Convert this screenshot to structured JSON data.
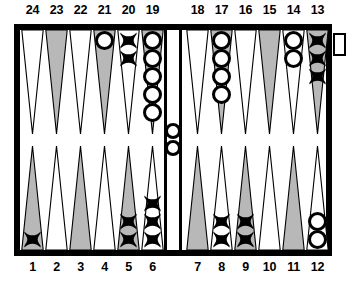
{
  "colors": {
    "board_frame": "#000000",
    "felt": "#ffffff",
    "point_shaded": "#b8b8b8",
    "point_plain": "#ffffff",
    "point_outline": "#000000",
    "checker_o_fill": "#ffffff",
    "checker_o_outline": "#000000",
    "checker_x": "#000000"
  },
  "labels": {
    "top": [
      "24",
      "23",
      "22",
      "21",
      "20",
      "19",
      "18",
      "17",
      "16",
      "15",
      "14",
      "13"
    ],
    "bottom": [
      "1",
      "2",
      "3",
      "4",
      "5",
      "6",
      "7",
      "8",
      "9",
      "10",
      "11",
      "12"
    ]
  },
  "board": {
    "bar": {
      "checkers": "O",
      "count": 2
    },
    "bearoff_tray": {
      "checkers": "",
      "count": 0
    },
    "points": [
      {
        "number": "24",
        "row": "top",
        "slot": 0,
        "shaded": false,
        "checkers": "",
        "count": 0
      },
      {
        "number": "23",
        "row": "top",
        "slot": 1,
        "shaded": true,
        "checkers": "",
        "count": 0
      },
      {
        "number": "22",
        "row": "top",
        "slot": 2,
        "shaded": false,
        "checkers": "",
        "count": 0
      },
      {
        "number": "21",
        "row": "top",
        "slot": 3,
        "shaded": true,
        "checkers": "O",
        "count": 1
      },
      {
        "number": "20",
        "row": "top",
        "slot": 4,
        "shaded": false,
        "checkers": "X",
        "count": 2
      },
      {
        "number": "19",
        "row": "top",
        "slot": 5,
        "shaded": true,
        "checkers": "O",
        "count": 5
      },
      {
        "number": "18",
        "row": "top",
        "slot": 6,
        "shaded": false,
        "checkers": "",
        "count": 0
      },
      {
        "number": "17",
        "row": "top",
        "slot": 7,
        "shaded": true,
        "checkers": "O",
        "count": 4
      },
      {
        "number": "16",
        "row": "top",
        "slot": 8,
        "shaded": false,
        "checkers": "",
        "count": 0
      },
      {
        "number": "15",
        "row": "top",
        "slot": 9,
        "shaded": true,
        "checkers": "",
        "count": 0
      },
      {
        "number": "14",
        "row": "top",
        "slot": 10,
        "shaded": false,
        "checkers": "O",
        "count": 2
      },
      {
        "number": "13",
        "row": "top",
        "slot": 11,
        "shaded": true,
        "checkers": "X",
        "count": 3
      },
      {
        "number": "1",
        "row": "bottom",
        "slot": 0,
        "shaded": true,
        "checkers": "X",
        "count": 1
      },
      {
        "number": "2",
        "row": "bottom",
        "slot": 1,
        "shaded": false,
        "checkers": "",
        "count": 0
      },
      {
        "number": "3",
        "row": "bottom",
        "slot": 2,
        "shaded": true,
        "checkers": "",
        "count": 0
      },
      {
        "number": "4",
        "row": "bottom",
        "slot": 3,
        "shaded": false,
        "checkers": "",
        "count": 0
      },
      {
        "number": "5",
        "row": "bottom",
        "slot": 4,
        "shaded": true,
        "checkers": "X",
        "count": 2
      },
      {
        "number": "6",
        "row": "bottom",
        "slot": 5,
        "shaded": false,
        "checkers": "X",
        "count": 3
      },
      {
        "number": "7",
        "row": "bottom",
        "slot": 6,
        "shaded": true,
        "checkers": "",
        "count": 0
      },
      {
        "number": "8",
        "row": "bottom",
        "slot": 7,
        "shaded": false,
        "checkers": "X",
        "count": 2
      },
      {
        "number": "9",
        "row": "bottom",
        "slot": 8,
        "shaded": true,
        "checkers": "X",
        "count": 2
      },
      {
        "number": "10",
        "row": "bottom",
        "slot": 9,
        "shaded": false,
        "checkers": "",
        "count": 0
      },
      {
        "number": "11",
        "row": "bottom",
        "slot": 10,
        "shaded": true,
        "checkers": "",
        "count": 0
      },
      {
        "number": "12",
        "row": "bottom",
        "slot": 11,
        "shaded": false,
        "checkers": "O",
        "count": 2
      }
    ]
  }
}
